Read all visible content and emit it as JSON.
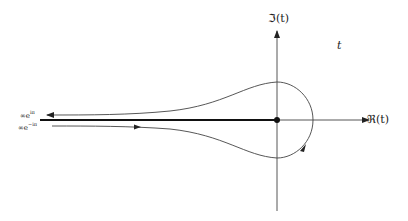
{
  "diagram": {
    "type": "contour-plot",
    "labels": {
      "imag_axis": "ℑ(t)",
      "real_axis": "ℜ(t)",
      "plane": "t",
      "upper_tail_base": "∞e",
      "upper_tail_exp": "iπ",
      "lower_tail_base": "∞e",
      "lower_tail_exp": "−iπ"
    },
    "colors": {
      "line": "#333333",
      "branch_cut": "#111111",
      "background": "#ffffff"
    }
  }
}
